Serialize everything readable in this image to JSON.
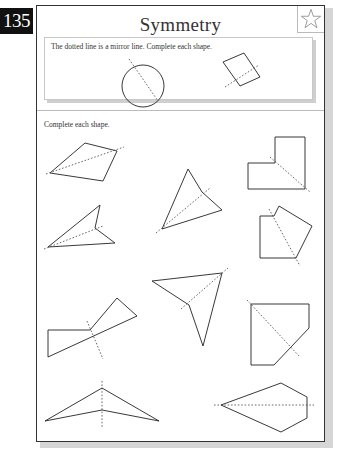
{
  "page": {
    "number": "135",
    "title": "Symmetry",
    "star_icon": "star-outline-icon"
  },
  "section_1": {
    "instruction": "The dotted line is a mirror line. Complete each shape.",
    "shapes": [
      {
        "name": "circle",
        "type": "circle",
        "center": [
          143,
          86
        ],
        "radius": 21,
        "mirror": [
          [
            129,
            59
          ],
          [
            158,
            101
          ]
        ]
      },
      {
        "name": "rectangle",
        "type": "polygon",
        "points": [
          [
            223,
            62
          ],
          [
            244,
            53
          ],
          [
            260,
            77
          ],
          [
            240,
            86
          ]
        ],
        "mirror": [
          [
            225,
            87
          ],
          [
            259,
            65
          ]
        ]
      }
    ]
  },
  "section_2": {
    "instruction": "Complete each shape.",
    "shapes": [
      {
        "name": "quadrilateral-kite",
        "points": [
          [
            50,
            173
          ],
          [
            85,
            143
          ],
          [
            117,
            151
          ],
          [
            103,
            181
          ]
        ],
        "mirror": [
          [
            46,
            174
          ],
          [
            124,
            147
          ]
        ]
      },
      {
        "name": "l-shape",
        "points": [
          [
            275,
            137
          ],
          [
            305,
            137
          ],
          [
            305,
            189
          ],
          [
            248,
            189
          ],
          [
            248,
            163
          ],
          [
            275,
            163
          ]
        ],
        "mirror": [
          [
            270,
            157
          ],
          [
            310,
            192
          ]
        ]
      },
      {
        "name": "triangle-top-middle",
        "points": [
          [
            188,
            169
          ],
          [
            202,
            192
          ],
          [
            222,
            210
          ],
          [
            162,
            229
          ]
        ],
        "mirror": [
          [
            156,
            233
          ],
          [
            210,
            188
          ]
        ]
      },
      {
        "name": "arrowhead-left",
        "points": [
          [
            48,
            247
          ],
          [
            100,
            205
          ],
          [
            95,
            228
          ],
          [
            115,
            243
          ]
        ],
        "mirror": [
          [
            44,
            249
          ],
          [
            103,
            226
          ]
        ]
      },
      {
        "name": "pentagon-right",
        "points": [
          [
            260,
            216
          ],
          [
            274,
            216
          ],
          [
            279,
            206
          ],
          [
            312,
            226
          ],
          [
            296,
            258
          ],
          [
            260,
            258
          ]
        ],
        "mirror": [
          [
            269,
            209
          ],
          [
            300,
            266
          ]
        ]
      },
      {
        "name": "triangle-middle-lower",
        "points": [
          [
            152,
            281
          ],
          [
            222,
            273
          ],
          [
            203,
            346
          ],
          [
            189,
            305
          ]
        ],
        "mirror": [
          [
            181,
            309
          ],
          [
            228,
            268
          ]
        ]
      },
      {
        "name": "bowtie-left",
        "points": [
          [
            48,
            330
          ],
          [
            48,
            357
          ],
          [
            137,
            316
          ],
          [
            117,
            298
          ],
          [
            90,
            330
          ]
        ],
        "mirror": [
          [
            87,
            321
          ],
          [
            103,
            359
          ]
        ]
      },
      {
        "name": "hexagon-right",
        "points": [
          [
            251,
            304
          ],
          [
            309,
            304
          ],
          [
            309,
            328
          ],
          [
            274,
            365
          ],
          [
            251,
            365
          ]
        ],
        "mirror": [
          [
            247,
            300
          ],
          [
            300,
            357
          ]
        ]
      },
      {
        "name": "arrow-bottom-left",
        "points": [
          [
            45,
            421
          ],
          [
            102,
            388
          ],
          [
            159,
            421
          ],
          [
            102,
            410
          ]
        ],
        "mirror": [
          [
            102,
            381
          ],
          [
            102,
            428
          ]
        ]
      },
      {
        "name": "kite-bottom-right",
        "points": [
          [
            221,
            405
          ],
          [
            281,
            383
          ],
          [
            307,
            397
          ],
          [
            307,
            418
          ],
          [
            281,
            432
          ]
        ],
        "mirror": [
          [
            214,
            405
          ],
          [
            314,
            405
          ]
        ]
      }
    ]
  },
  "colors": {
    "ink": "#222222",
    "page_number_bg": "#111111",
    "shadow": "#d6d6d6"
  }
}
